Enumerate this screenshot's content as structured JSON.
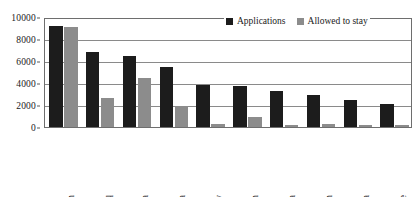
{
  "chart_data": {
    "type": "bar",
    "title": "",
    "subtitle": "",
    "xlabel": "",
    "ylabel": "",
    "ylim": [
      0,
      10000
    ],
    "yticks": [
      0,
      2000,
      4000,
      6000,
      8000,
      10000
    ],
    "ytick_labels": [
      "0",
      "2000",
      "4000",
      "6000",
      "8000",
      "10000"
    ],
    "grid": true,
    "grid_axis": "y",
    "legend_position": "top-right",
    "categories": [
      "Afghanistan",
      "Iraq",
      "Somalia",
      "Sri Lanka",
      "Turkey",
      "Iran",
      "FR Yugoslavia",
      "Pakistan",
      "China",
      "Zimbabwe"
    ],
    "series": [
      {
        "name": "Applications",
        "color": "#1c1c1c",
        "values": [
          9200,
          6800,
          6500,
          5500,
          3800,
          3700,
          3300,
          2900,
          2500,
          2100
        ]
      },
      {
        "name": "Allowed to stay",
        "color": "#8c8c8c",
        "values": [
          9050,
          2600,
          4500,
          1950,
          300,
          900,
          200,
          250,
          220,
          150
        ]
      }
    ]
  },
  "legend": {
    "entries": [
      {
        "label": "Applications",
        "color": "#1c1c1c"
      },
      {
        "label": "Allowed to stay",
        "color": "#8c8c8c"
      }
    ]
  }
}
